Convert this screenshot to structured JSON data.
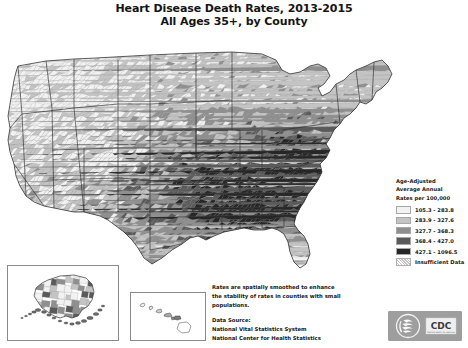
{
  "title": {
    "line1": "Heart Disease Death Rates, 2013-2015",
    "line2": "All Ages 35+, by County"
  },
  "legend": {
    "title_line1": "Age-Adjusted",
    "title_line2": "Average Annual",
    "title_line3": "Rates per 100,000",
    "rows": [
      {
        "label": "105.3 - 283.8",
        "color": "#f2f2f2"
      },
      {
        "label": "283.9 - 327.6",
        "color": "#c4c4c4"
      },
      {
        "label": "327.7 - 368.3",
        "color": "#8f8f8f"
      },
      {
        "label": "368.4 - 427.0",
        "color": "#5a5a5a"
      },
      {
        "label": "427.1 - 1096.5",
        "color": "#262626"
      },
      {
        "label": "Insufficient Data",
        "color": "hatched"
      }
    ]
  },
  "notes": {
    "smoothing_line1": "Rates are spatially smoothed to enhance",
    "smoothing_line2": "the stability of rates in counties with small",
    "smoothing_line3": "populations.",
    "source_line1": "Data Source:",
    "source_line2": "National Vital Statistics System",
    "source_line3": "National Center for Health Statistics"
  },
  "logo": {
    "text": "CDC",
    "subtext": "DEPARTMENT OF HEALTH"
  },
  "insets": {
    "alaska_label": "Alaska",
    "hawaii_label": "Hawaii"
  },
  "chart_data": {
    "type": "choropleth-map",
    "title": "Heart Disease Death Rates, 2013-2015 All Ages 35+, by County",
    "unit": "Age-Adjusted Average Annual Rates per 100,000",
    "geography": "United States counties",
    "classes": [
      {
        "min": 105.3,
        "max": 283.8,
        "color": "#f2f2f2"
      },
      {
        "min": 283.9,
        "max": 327.6,
        "color": "#c4c4c4"
      },
      {
        "min": 327.7,
        "max": 368.3,
        "color": "#8f8f8f"
      },
      {
        "min": 368.4,
        "max": 427.0,
        "color": "#5a5a5a"
      },
      {
        "min": 427.1,
        "max": 1096.5,
        "color": "#262626"
      }
    ],
    "no_data_class": "Insufficient Data",
    "regional_pattern": [
      {
        "region": "Southeast / Mississippi Delta",
        "dominant_class": 5,
        "note": "highest rates, dark cluster"
      },
      {
        "region": "Appalachia / Kentucky / West Virginia",
        "dominant_class": 4,
        "note": "elevated rates"
      },
      {
        "region": "Oklahoma / Arkansas / Texas east",
        "dominant_class": 4,
        "note": "elevated rates"
      },
      {
        "region": "Upper Midwest / Plains",
        "dominant_class": 2,
        "note": "low to moderate rates"
      },
      {
        "region": "Mountain West / Colorado",
        "dominant_class": 1,
        "note": "lowest rates"
      },
      {
        "region": "Pacific Northwest",
        "dominant_class": 1,
        "note": "lowest rates"
      },
      {
        "region": "Northeast / New England",
        "dominant_class": 2,
        "note": "low to moderate rates"
      },
      {
        "region": "Florida peninsula",
        "dominant_class": 2,
        "note": "low to moderate rates"
      }
    ]
  }
}
